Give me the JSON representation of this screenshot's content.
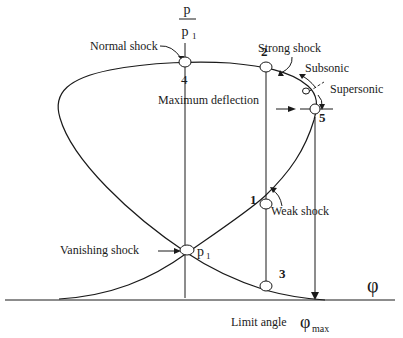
{
  "diagram": {
    "type": "shock-polar",
    "y_axis": {
      "numerator": "p",
      "denominator": "p",
      "denominator_subscript": "1"
    },
    "x_axis": {
      "label": "φ"
    },
    "labels": {
      "normal_shock": "Normal shock",
      "strong_shock": "Strong shock",
      "subsonic": "Subsonic",
      "supersonic": "Supersonic",
      "maximum_deflection": "Maximum deflection",
      "weak_shock": "Weak shock",
      "vanishing_shock": "Vanishing shock",
      "limit_angle": "Limit angle",
      "phi_max": "φ",
      "phi_max_subscript": "max",
      "p1_point": "p",
      "p1_point_subscript": "1"
    },
    "points": [
      {
        "id": "4",
        "label": "4",
        "description": "Normal shock"
      },
      {
        "id": "2",
        "label": "2",
        "description": "Strong shock point"
      },
      {
        "id": "5",
        "label": "5",
        "description": "Sonic point"
      },
      {
        "id": "1",
        "label": "1",
        "description": "Weak shock point"
      },
      {
        "id": "3",
        "label": "3",
        "description": "Lower branch point"
      }
    ]
  }
}
